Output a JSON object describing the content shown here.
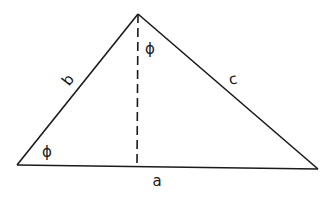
{
  "diagram": {
    "type": "triangle",
    "vertices": {
      "left": {
        "x": 17,
        "y": 165
      },
      "apex": {
        "x": 138,
        "y": 14
      },
      "right": {
        "x": 318,
        "y": 169
      }
    },
    "altitude": {
      "from": {
        "x": 138,
        "y": 14
      },
      "to": {
        "x": 137,
        "y": 166
      },
      "style": "dashed"
    },
    "labels": {
      "side_a": "a",
      "side_b": "b",
      "side_c": "c",
      "angle_left": "ϕ",
      "angle_apex": "ϕ"
    },
    "colors": {
      "stroke": "#1a1a1a",
      "background": "#ffffff"
    }
  }
}
